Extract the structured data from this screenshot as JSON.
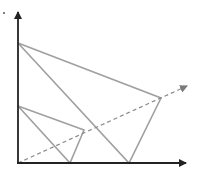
{
  "diagram": {
    "colors": {
      "axis": "#222222",
      "triangle": "#a0a0a0",
      "ray": "#8a8a8a",
      "background": "#ffffff"
    },
    "origin": [
      18,
      163
    ],
    "axes": {
      "y_axis": {
        "from": [
          18,
          163
        ],
        "to": [
          18,
          12
        ]
      },
      "x_axis": {
        "from": [
          18,
          163
        ],
        "to": [
          186,
          163
        ]
      }
    },
    "triangles": [
      {
        "name": "large",
        "points": [
          [
            18,
            43
          ],
          [
            161,
            98
          ],
          [
            129,
            163
          ]
        ]
      },
      {
        "name": "small",
        "points": [
          [
            18,
            106
          ],
          [
            84,
            130
          ],
          [
            70,
            163
          ]
        ]
      }
    ],
    "ray": {
      "from": [
        18,
        163
      ],
      "to": [
        188,
        86
      ],
      "style": "dashed"
    },
    "marker_dot": [
      4,
      13
    ]
  }
}
